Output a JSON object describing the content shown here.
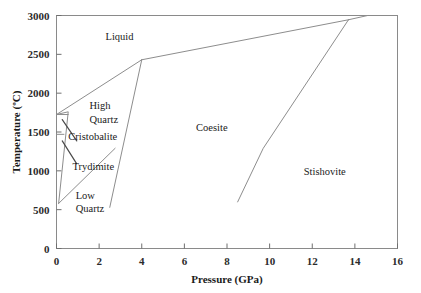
{
  "figure": {
    "clipped_caption_top": "",
    "background_color": "#ffffff",
    "line_color": "#8d8d8d",
    "text_color": "#1a1a1a"
  },
  "chart_data": {
    "type": "line",
    "title": "",
    "xlabel": "Pressure (GPa)",
    "ylabel": "Temperature (ºC)",
    "xlim": [
      0,
      16
    ],
    "ylim": [
      0,
      3000
    ],
    "xticks": [
      0,
      2,
      4,
      6,
      8,
      10,
      12,
      14,
      16
    ],
    "xticklabels": [
      "0",
      "2",
      "4",
      "6",
      "8",
      "10",
      "12",
      "14",
      "16"
    ],
    "yticks": [
      0,
      500,
      1000,
      1500,
      2000,
      2500,
      3000
    ],
    "yticklabels": [
      "0",
      "500",
      "1000",
      "1500",
      "2000",
      "2500",
      "3000"
    ],
    "grid": false,
    "legend": "none",
    "frame": "full-box",
    "series": [
      {
        "name": "liquidus-quartz",
        "comment": "Liquid / High Quartz melting boundary",
        "points": [
          [
            0.0,
            1725
          ],
          [
            4.0,
            2430
          ]
        ]
      },
      {
        "name": "liquidus-coesite",
        "comment": "Liquid / Coesite melting boundary",
        "points": [
          [
            4.0,
            2430
          ],
          [
            13.7,
            2945
          ]
        ]
      },
      {
        "name": "liquidus-stishovite",
        "comment": "Liquid / Stishovite melting boundary",
        "points": [
          [
            13.7,
            2945
          ],
          [
            14.6,
            3000
          ]
        ]
      },
      {
        "name": "quartz-coesite",
        "comment": "High/Low Quartz to Coesite transition",
        "points": [
          [
            4.0,
            2430
          ],
          [
            2.5,
            530
          ]
        ]
      },
      {
        "name": "coesite-stishovite",
        "comment": "Coesite / Stishovite transition",
        "points": [
          [
            8.5,
            600
          ],
          [
            9.7,
            1290
          ],
          [
            13.7,
            2945
          ]
        ]
      },
      {
        "name": "low-high-quartz",
        "comment": "Low Quartz / High Quartz transition",
        "points": [
          [
            0.1,
            580
          ],
          [
            2.75,
            1290
          ]
        ]
      },
      {
        "name": "quartz-tridymite-cristobalite-left",
        "comment": "Left-axis stack of quartz polymorph fields",
        "points": [
          [
            0.0,
            1725
          ],
          [
            0.55,
            1760
          ],
          [
            0.1,
            580
          ]
        ]
      },
      {
        "name": "cristobalite-upper-tie",
        "comment": "Horizontal tie at cristobalite upper limit",
        "points": [
          [
            0.0,
            1725
          ],
          [
            0.55,
            1725
          ]
        ]
      },
      {
        "name": "cristobalite-lower-tie",
        "comment": "Horizontal tie at cristobalite lower limit",
        "points": [
          [
            0.0,
            1470
          ],
          [
            0.35,
            1470
          ]
        ]
      }
    ],
    "annotations": [
      {
        "text": "Liquid",
        "x": 2.3,
        "y": 2690
      },
      {
        "text": "High",
        "x": 1.55,
        "y": 1790
      },
      {
        "text": "Quartz",
        "x": 1.55,
        "y": 1620
      },
      {
        "text": "Cristobalite",
        "x": 0.55,
        "y": 1400
      },
      {
        "text": "Trydimite",
        "x": 0.75,
        "y": 1010
      },
      {
        "text": "Low",
        "x": 0.9,
        "y": 640
      },
      {
        "text": "Quartz",
        "x": 0.9,
        "y": 470
      },
      {
        "text": "Coesite",
        "x": 6.55,
        "y": 1510
      },
      {
        "text": "Stishovite",
        "x": 11.6,
        "y": 950
      }
    ],
    "leaders": [
      {
        "name": "cristobalite-leader",
        "from": [
          0.27,
          1660
        ],
        "to": [
          0.95,
          1385
        ]
      },
      {
        "name": "trydimite-leader",
        "from": [
          0.27,
          1385
        ],
        "to": [
          0.95,
          1090
        ]
      }
    ]
  }
}
